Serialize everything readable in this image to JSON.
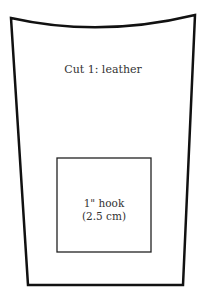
{
  "diagram": {
    "pattern_piece": {
      "label": "Cut 1: leather",
      "stroke_color": "#111111"
    },
    "hook_area": {
      "line1": "1\" hook",
      "line2": "(2.5 cm)",
      "stroke_color": "#222222"
    }
  }
}
